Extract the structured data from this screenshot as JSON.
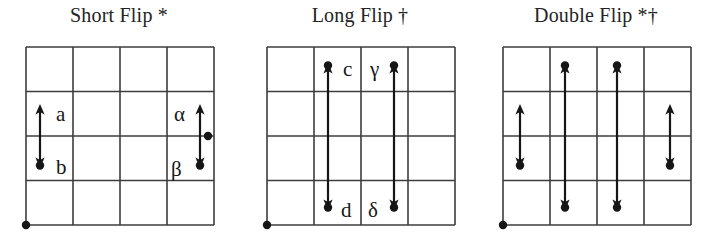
{
  "figure": {
    "background_color": "#ffffff",
    "line_color": "#3d3d3d",
    "ink_color": "#161616",
    "panels": [
      {
        "id": "short-flip",
        "title": "Short Flip *",
        "grid": {
          "cols": 4,
          "rows": 4
        },
        "origin_dot": true,
        "arrows": [
          {
            "name": "arrow-a-b",
            "kind": "short",
            "column_line": 1,
            "span_rows": "2-3",
            "dot_end": "bottom",
            "labels": {
              "top": "a",
              "bottom": "b"
            }
          },
          {
            "name": "arrow-alpha-beta",
            "kind": "short",
            "column_line": 4,
            "span_rows": "2-3",
            "dot_end": "bottom",
            "dot_middle": true,
            "labels": {
              "top": "α",
              "bottom": "β"
            }
          }
        ],
        "labels": [
          "a",
          "b",
          "α",
          "β"
        ]
      },
      {
        "id": "long-flip",
        "title": "Long Flip †",
        "grid": {
          "cols": 4,
          "rows": 4
        },
        "origin_dot": true,
        "arrows": [
          {
            "name": "arrow-c-d",
            "kind": "long",
            "column_line": 2,
            "span_rows": "1-4",
            "dot_end": "both",
            "labels": {
              "top": "c",
              "bottom": "d"
            }
          },
          {
            "name": "arrow-gamma-delta",
            "kind": "long",
            "column_line": 3,
            "span_rows": "1-4",
            "dot_end": "both",
            "labels": {
              "top": "γ",
              "bottom": "δ"
            }
          }
        ],
        "labels": [
          "c",
          "γ",
          "d",
          "δ"
        ]
      },
      {
        "id": "double-flip",
        "title": "Double Flip *†",
        "grid": {
          "cols": 4,
          "rows": 4
        },
        "origin_dot": true,
        "arrows": [
          {
            "name": "arrow-short-left",
            "kind": "short",
            "column_line": 1,
            "span_rows": "2-3",
            "dot_end": "bottom",
            "labels": {
              "top": "",
              "bottom": ""
            }
          },
          {
            "name": "arrow-long-second",
            "kind": "long",
            "column_line": 2,
            "span_rows": "1-4",
            "dot_end": "both",
            "labels": {
              "top": "",
              "bottom": ""
            }
          },
          {
            "name": "arrow-long-third",
            "kind": "long",
            "column_line": 3,
            "span_rows": "1-4",
            "dot_end": "both",
            "labels": {
              "top": "",
              "bottom": ""
            }
          },
          {
            "name": "arrow-short-right",
            "kind": "short",
            "column_line": 4,
            "span_rows": "2-3",
            "dot_end": "bottom",
            "labels": {
              "top": "",
              "bottom": ""
            }
          }
        ],
        "labels": []
      }
    ]
  }
}
